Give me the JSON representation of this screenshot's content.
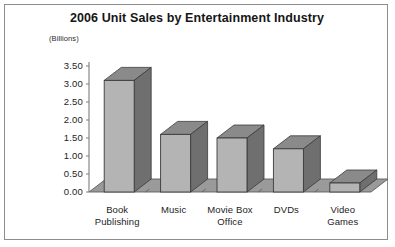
{
  "chart_data": {
    "type": "bar",
    "title": "2006 Unit Sales by Entertainment Industry",
    "ylabel": "(Billions)",
    "xlabel": "",
    "categories": [
      "Book Publishing",
      "Music",
      "Movie Box Office",
      "DVDs",
      "Video Games"
    ],
    "category_lines": [
      [
        "Book",
        "Publishing"
      ],
      [
        "Music",
        ""
      ],
      [
        "Movie Box",
        "Office"
      ],
      [
        "DVDs",
        ""
      ],
      [
        "Video",
        "Games"
      ]
    ],
    "values": [
      3.1,
      1.6,
      1.5,
      1.2,
      0.25
    ],
    "ylim": [
      0.0,
      3.5
    ],
    "ytick_values": [
      0.0,
      0.5,
      1.0,
      1.5,
      2.0,
      2.5,
      3.0,
      3.5
    ],
    "ytick_labels": [
      "0.00",
      "0.50",
      "1.00",
      "1.50",
      "2.00",
      "2.50",
      "3.00",
      "3.50"
    ],
    "grid": false,
    "legend": false,
    "style": "3d-column",
    "colors": {
      "bar_front": "#b4b4b4",
      "bar_side": "#6f6f6f",
      "bar_top": "#8a8a8a",
      "bar_outline": "#3a3a3a",
      "floor": "#9a9a9a",
      "floor_outline": "#5e5e5e",
      "axis": "#7d7d7d",
      "border": "#8d8d8d",
      "background": "#ffffff",
      "text": "#1d1d1d"
    }
  }
}
